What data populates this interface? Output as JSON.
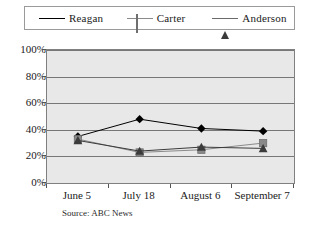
{
  "chart_data": {
    "type": "line",
    "title": "",
    "xlabel": "",
    "ylabel": "",
    "categories": [
      "June 5",
      "July 18",
      "August 6",
      "September 7"
    ],
    "ylim": [
      0,
      100
    ],
    "yticks": [
      "0%",
      "20%",
      "40%",
      "60%",
      "80%",
      "100%"
    ],
    "ytick_values": [
      0,
      20,
      40,
      60,
      80,
      100
    ],
    "grid": true,
    "legend_position": "top",
    "source": "Source: ABC News",
    "series": [
      {
        "name": "Reagan",
        "marker": "diamond",
        "color": "#000000",
        "values": [
          35,
          48,
          41,
          39
        ]
      },
      {
        "name": "Carter",
        "marker": "square",
        "color": "#8a8a8a",
        "values": [
          33,
          23,
          25,
          30
        ]
      },
      {
        "name": "Anderson",
        "marker": "triangle",
        "color": "#3b3b3b",
        "values": [
          32,
          24,
          27,
          26
        ]
      }
    ]
  },
  "legend": {
    "items": [
      {
        "label": "Reagan",
        "icon": "diamond-marker-icon"
      },
      {
        "label": "Carter",
        "icon": "square-marker-icon"
      },
      {
        "label": "Anderson",
        "icon": "triangle-marker-icon"
      }
    ]
  }
}
